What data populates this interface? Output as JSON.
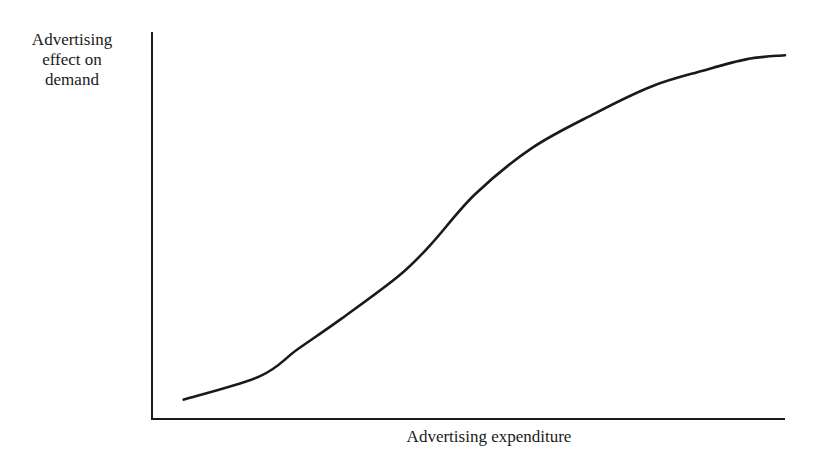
{
  "chart_data": {
    "type": "line",
    "title": "",
    "xlabel": "Advertising expenditure",
    "ylabel": "Advertising effect on demand",
    "ylabel_lines": [
      "Advertising",
      "effect on",
      "demand"
    ],
    "grid": false,
    "legend": null,
    "ticks": {
      "x": [],
      "y": []
    },
    "xlim": [
      0,
      100
    ],
    "ylim": [
      0,
      100
    ],
    "series": [
      {
        "name": "S-shaped advertising response curve",
        "shape": "sigmoid",
        "x": [
          5,
          17,
          23,
          30,
          39,
          44,
          51,
          60,
          70,
          79,
          87,
          94,
          100
        ],
        "y": [
          5,
          11,
          18,
          26,
          37,
          45,
          58,
          70,
          79,
          86,
          90,
          93,
          94
        ]
      }
    ],
    "colors": {
      "line": "#1a1a1a",
      "axes": "#1a1a1a",
      "background": "#ffffff"
    }
  }
}
